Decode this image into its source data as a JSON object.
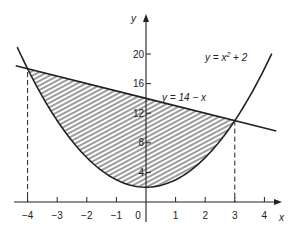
{
  "chart_data": {
    "type": "line",
    "title": "",
    "xlabel": "x",
    "ylabel": "y",
    "xlim": [
      -4.4,
      4.6
    ],
    "ylim": [
      -2.5,
      25
    ],
    "x_ticks": [
      -4,
      -3,
      -2,
      -1,
      0,
      1,
      2,
      3,
      4
    ],
    "x_tick_labels": [
      "-4",
      "-3",
      "-2",
      "-1",
      "0",
      "1",
      "2",
      "3",
      "4"
    ],
    "y_ticks": [
      4,
      8,
      12,
      16,
      20
    ],
    "y_tick_labels": [
      "4",
      "8",
      "12",
      "16",
      "20"
    ],
    "grid": false,
    "series": [
      {
        "name": "y = x² + 2",
        "equation": "y = x^2 + 2",
        "x_range": [
          -4.35,
          4.25
        ],
        "style": "solid"
      },
      {
        "name": "y = 14 − x",
        "equation": "y = 14 - x",
        "x_range": [
          -4.4,
          4.4
        ],
        "style": "solid"
      }
    ],
    "shaded_region": {
      "between": [
        "y = 14 - x",
        "y = x^2 + 2"
      ],
      "x_range": [
        -4,
        3
      ],
      "pattern": "diagonal-hatch"
    },
    "intersections": [
      {
        "x": -4,
        "y": 18
      },
      {
        "x": 3,
        "y": 11
      }
    ],
    "dashed_verticals": [
      -4,
      3
    ],
    "annotations": [
      {
        "text": "y = x² + 2",
        "position": "upper right"
      },
      {
        "text": "y = 14 − x",
        "position": "near line, right of y-axis"
      }
    ]
  },
  "labels": {
    "x_axis": "x",
    "y_axis": "y",
    "eq_parabola_a": "y = x",
    "eq_parabola_sup": "2",
    "eq_parabola_b": " + 2",
    "eq_line": "y = 14 − x",
    "xt": [
      "−4",
      "−3",
      "−2",
      "−1",
      "0",
      "1",
      "2",
      "3",
      "4"
    ],
    "yt": [
      "4",
      "8",
      "12",
      "16",
      "20"
    ]
  },
  "colors": {
    "ink": "#222222",
    "background": "#ffffff"
  }
}
